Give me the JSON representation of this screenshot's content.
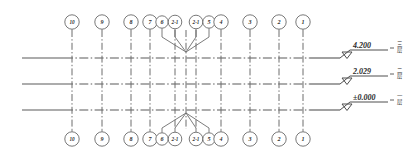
{
  "drawing": {
    "title": "Structural Column Grid Elevation",
    "background_color": "#ffffff",
    "line_color": "#6d6d6d",
    "text_color": "#2e2e2e",
    "width": 411,
    "height": 161
  },
  "grid_bubbles": {
    "top_row_label": "Top grid axis labels",
    "bottom_row_label": "Bottom grid axis labels",
    "items": [
      {
        "label": "10",
        "x": 72,
        "bubble_x": 72,
        "r": 7.2
      },
      {
        "label": "9",
        "x": 102,
        "bubble_x": 102,
        "r": 7.2
      },
      {
        "label": "8",
        "x": 131,
        "bubble_x": 131,
        "r": 7.2
      },
      {
        "label": "7",
        "x": 150,
        "bubble_x": 150,
        "r": 7.2
      },
      {
        "label": "6",
        "x": 162,
        "bubble_x": 162,
        "r": 6.2
      },
      {
        "label": "2-1",
        "x": 175,
        "bubble_x": 175,
        "r": 6.8
      },
      {
        "label": "2-1",
        "x": 196,
        "bubble_x": 196,
        "r": 6.8
      },
      {
        "label": "5",
        "x": 209,
        "bubble_x": 209,
        "r": 6.2
      },
      {
        "label": "4",
        "x": 221,
        "bubble_x": 221,
        "r": 7.2
      },
      {
        "label": "3",
        "x": 250,
        "bubble_x": 250,
        "r": 7.2
      },
      {
        "label": "2",
        "x": 279,
        "bubble_x": 279,
        "r": 7.2
      },
      {
        "label": "1",
        "x": 303,
        "bubble_x": 303,
        "r": 7.2
      }
    ]
  },
  "floor_levels": [
    {
      "elevation": "4.200",
      "floor_name": "三层",
      "y": 58,
      "marker_x": 340,
      "label": "Third floor level"
    },
    {
      "elevation": "2.029",
      "floor_name": "二层",
      "y": 84,
      "marker_x": 340,
      "label": "Second floor level"
    },
    {
      "elevation": "±0.000",
      "floor_name": "一层",
      "y": 110,
      "marker_x": 340,
      "label": "Ground floor level"
    }
  ],
  "column_axes": {
    "label": "Vertical column grid lines",
    "top_y": 30,
    "bottom_y": 129,
    "x_positions": [
      72,
      102,
      131,
      150,
      175,
      186,
      196,
      221,
      250,
      279,
      303
    ]
  },
  "branch_leaders": {
    "label": "Converging leader lines to shared axis",
    "apex_x": 186,
    "top": {
      "apex_y": 52,
      "from": [
        {
          "x": 162,
          "y": 37
        },
        {
          "x": 175,
          "y": 37
        },
        {
          "x": 196,
          "y": 37
        },
        {
          "x": 209,
          "y": 37
        }
      ]
    },
    "bottom": {
      "apex_y": 113,
      "from": [
        {
          "x": 162,
          "y": 128
        },
        {
          "x": 175,
          "y": 128
        },
        {
          "x": 196,
          "y": 128
        },
        {
          "x": 209,
          "y": 128
        }
      ]
    }
  },
  "horizontal_extent": {
    "left_x": 22,
    "right_x": 330
  }
}
